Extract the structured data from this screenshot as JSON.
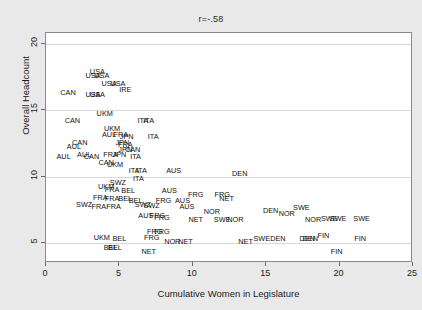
{
  "chart_data": {
    "type": "scatter",
    "title": "r=-.58",
    "xlabel": "Cumulative Women in Legislature",
    "ylabel": "Overall Headcount",
    "xlim": [
      0,
      25
    ],
    "ylim": [
      3.5,
      20.8
    ],
    "xticks": [
      0,
      5,
      10,
      15,
      20,
      25
    ],
    "yticks": [
      5,
      10,
      15,
      20
    ],
    "grid": "horizontal",
    "marker_style": "country-code-text-label",
    "legend": "none",
    "annotation": "r=-.58",
    "points": [
      {
        "label": "USA",
        "x": 3.5,
        "y": 17.9
      },
      {
        "label": "USA",
        "x": 3.2,
        "y": 17.6
      },
      {
        "label": "USA",
        "x": 3.8,
        "y": 17.6
      },
      {
        "label": "USA",
        "x": 4.3,
        "y": 17.0
      },
      {
        "label": "USA",
        "x": 4.9,
        "y": 17.0
      },
      {
        "label": "IRE",
        "x": 5.4,
        "y": 16.5
      },
      {
        "label": "CAN",
        "x": 1.5,
        "y": 16.3
      },
      {
        "label": "USA",
        "x": 3.2,
        "y": 16.1
      },
      {
        "label": "USA",
        "x": 3.5,
        "y": 16.1
      },
      {
        "label": "UKM",
        "x": 4.0,
        "y": 14.7
      },
      {
        "label": "CAN",
        "x": 1.8,
        "y": 14.2
      },
      {
        "label": "ITA",
        "x": 6.6,
        "y": 14.2
      },
      {
        "label": "ITA",
        "x": 7.0,
        "y": 14.2
      },
      {
        "label": "UKM",
        "x": 4.5,
        "y": 13.6
      },
      {
        "label": "AUL",
        "x": 4.3,
        "y": 13.1
      },
      {
        "label": "FRA",
        "x": 5.1,
        "y": 13.1
      },
      {
        "label": "JPN",
        "x": 5.5,
        "y": 13.0
      },
      {
        "label": "ITA",
        "x": 7.3,
        "y": 13.0
      },
      {
        "label": "CAN",
        "x": 2.3,
        "y": 12.5
      },
      {
        "label": "AUL",
        "x": 1.9,
        "y": 12.2
      },
      {
        "label": "JPN",
        "x": 5.2,
        "y": 12.5
      },
      {
        "label": "FRA",
        "x": 5.4,
        "y": 12.4
      },
      {
        "label": "JPN",
        "x": 5.4,
        "y": 12.0
      },
      {
        "label": "CAN",
        "x": 5.9,
        "y": 12.0
      },
      {
        "label": "AUL",
        "x": 1.2,
        "y": 11.5
      },
      {
        "label": "AUL",
        "x": 2.6,
        "y": 11.6
      },
      {
        "label": "CAN",
        "x": 3.1,
        "y": 11.5
      },
      {
        "label": "FRA",
        "x": 4.4,
        "y": 11.6
      },
      {
        "label": "JPN",
        "x": 5.0,
        "y": 11.6
      },
      {
        "label": "ITA",
        "x": 6.1,
        "y": 11.5
      },
      {
        "label": "CAN",
        "x": 4.1,
        "y": 11.0
      },
      {
        "label": "UKM",
        "x": 4.7,
        "y": 10.9
      },
      {
        "label": "ITA",
        "x": 6.0,
        "y": 10.4
      },
      {
        "label": "ITA",
        "x": 6.5,
        "y": 10.4
      },
      {
        "label": "AUS",
        "x": 8.7,
        "y": 10.4
      },
      {
        "label": "DEN",
        "x": 13.2,
        "y": 10.2
      },
      {
        "label": "ITA",
        "x": 6.3,
        "y": 9.8
      },
      {
        "label": "SWZ",
        "x": 4.9,
        "y": 9.5
      },
      {
        "label": "UKM",
        "x": 4.1,
        "y": 9.2
      },
      {
        "label": "FRA",
        "x": 4.5,
        "y": 9.0
      },
      {
        "label": "BEL",
        "x": 5.6,
        "y": 8.9
      },
      {
        "label": "AUS",
        "x": 8.4,
        "y": 8.9
      },
      {
        "label": "FRG",
        "x": 10.2,
        "y": 8.6
      },
      {
        "label": "FRG",
        "x": 12.0,
        "y": 8.6
      },
      {
        "label": "NET",
        "x": 12.3,
        "y": 8.3
      },
      {
        "label": "FRA",
        "x": 3.7,
        "y": 8.4
      },
      {
        "label": "FRA",
        "x": 4.5,
        "y": 8.3
      },
      {
        "label": "BEL",
        "x": 5.4,
        "y": 8.3
      },
      {
        "label": "BEL",
        "x": 6.1,
        "y": 8.2
      },
      {
        "label": "FRG",
        "x": 8.0,
        "y": 8.2
      },
      {
        "label": "AUS",
        "x": 9.3,
        "y": 8.2
      },
      {
        "label": "SWZ",
        "x": 2.6,
        "y": 7.9
      },
      {
        "label": "FRA",
        "x": 3.6,
        "y": 7.7
      },
      {
        "label": "FRA",
        "x": 4.6,
        "y": 7.7
      },
      {
        "label": "SWZ",
        "x": 6.6,
        "y": 7.9
      },
      {
        "label": "SWZ",
        "x": 7.2,
        "y": 7.8
      },
      {
        "label": "AUS",
        "x": 9.6,
        "y": 7.7
      },
      {
        "label": "NOR",
        "x": 11.3,
        "y": 7.3
      },
      {
        "label": "DEN",
        "x": 15.3,
        "y": 7.4
      },
      {
        "label": "NOR",
        "x": 16.4,
        "y": 7.2
      },
      {
        "label": "SWE",
        "x": 17.4,
        "y": 7.6
      },
      {
        "label": "AUS",
        "x": 6.8,
        "y": 7.0
      },
      {
        "label": "FRG",
        "x": 7.6,
        "y": 7.0
      },
      {
        "label": "FRG",
        "x": 7.9,
        "y": 6.9
      },
      {
        "label": "NET",
        "x": 10.2,
        "y": 6.7
      },
      {
        "label": "SWE",
        "x": 12.0,
        "y": 6.7
      },
      {
        "label": "NOR",
        "x": 12.9,
        "y": 6.7
      },
      {
        "label": "NOR",
        "x": 18.2,
        "y": 6.7
      },
      {
        "label": "SWE",
        "x": 19.3,
        "y": 6.8
      },
      {
        "label": "SWE",
        "x": 19.9,
        "y": 6.8
      },
      {
        "label": "SWE",
        "x": 21.5,
        "y": 6.8
      },
      {
        "label": "FRG",
        "x": 7.4,
        "y": 5.8
      },
      {
        "label": "FRG",
        "x": 7.9,
        "y": 5.8
      },
      {
        "label": "UKM",
        "x": 3.8,
        "y": 5.4
      },
      {
        "label": "BEL",
        "x": 5.0,
        "y": 5.3
      },
      {
        "label": "FRG",
        "x": 7.2,
        "y": 5.4
      },
      {
        "label": "NOR",
        "x": 8.6,
        "y": 5.1
      },
      {
        "label": "NET",
        "x": 9.5,
        "y": 5.1
      },
      {
        "label": "NET",
        "x": 13.6,
        "y": 5.1
      },
      {
        "label": "SWE",
        "x": 14.7,
        "y": 5.3
      },
      {
        "label": "DEN",
        "x": 15.8,
        "y": 5.3
      },
      {
        "label": "DEN",
        "x": 17.8,
        "y": 5.3
      },
      {
        "label": "DEN",
        "x": 18.0,
        "y": 5.3
      },
      {
        "label": "FIN",
        "x": 18.9,
        "y": 5.5
      },
      {
        "label": "FIN",
        "x": 21.4,
        "y": 5.3
      },
      {
        "label": "BEL",
        "x": 4.4,
        "y": 4.6
      },
      {
        "label": "BEL",
        "x": 4.7,
        "y": 4.6
      },
      {
        "label": "NET",
        "x": 7.0,
        "y": 4.3
      },
      {
        "label": "FIN",
        "x": 19.8,
        "y": 4.3
      }
    ]
  }
}
